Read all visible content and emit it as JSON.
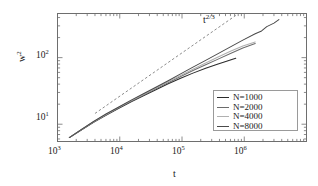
{
  "figure": {
    "background": "#ffffff",
    "frame_color": "#6e6e6e"
  },
  "annotations": {
    "slope_guide": {
      "base": "t",
      "exponent": "2/3",
      "style": "dashed",
      "color": "#8c8c8c"
    }
  },
  "legend": {
    "position": "lower-right",
    "border_color": "#9a9a9a",
    "items": [
      {
        "label": "N=1000",
        "color": "#2b2b2b"
      },
      {
        "label": "N=2000",
        "color": "#6b6b6b"
      },
      {
        "label": "N=4000",
        "color": "#b0b0b0"
      },
      {
        "label": "N=8000",
        "color": "#4a4a4a"
      }
    ]
  },
  "axes": {
    "x": {
      "title": "t",
      "scale": "log",
      "min": 1000,
      "max": 10000000,
      "tick_labels": [
        "10",
        "10",
        "10",
        "10"
      ],
      "tick_exponents": [
        "3",
        "4",
        "5",
        "6"
      ]
    },
    "y": {
      "title": "w",
      "title_exponent": "2",
      "scale": "log",
      "min": 5.5,
      "max": 460,
      "tick_labels": [
        "10",
        "10"
      ],
      "tick_exponents": [
        "1",
        "2"
      ]
    }
  },
  "chart_data": {
    "type": "line",
    "title": "",
    "xlabel": "t",
    "ylabel": "w^2",
    "xscale": "log",
    "yscale": "log",
    "xlim": [
      1000,
      10000000
    ],
    "ylim": [
      5.5,
      460
    ],
    "grid": false,
    "legend_position": "lower-right",
    "annotations": [
      {
        "text": "t^2/3",
        "x": 120000,
        "y": 330,
        "style": "dashed-guide",
        "slope": 0.6667
      }
    ],
    "guide_line": {
      "label": "t^2/3",
      "slope": 0.6667,
      "x": [
        4000,
        730000
      ],
      "y": [
        14.5,
        430
      ],
      "dash": true,
      "color": "#8c8c8c"
    },
    "series": [
      {
        "name": "N=1000",
        "color": "#2b2b2b",
        "x": [
          1550,
          2400,
          3800,
          6000,
          9500,
          15000,
          24000,
          38000,
          60000,
          95000,
          150000,
          240000,
          380000,
          520000,
          650000,
          730000
        ],
        "y": [
          6.3,
          8.2,
          10.7,
          13.6,
          17.2,
          21.6,
          26.8,
          33.0,
          40.5,
          49.0,
          58.5,
          69.0,
          80.0,
          88.0,
          94.5,
          98.0
        ]
      },
      {
        "name": "N=2000",
        "color": "#6b6b6b",
        "x": [
          1550,
          2400,
          3800,
          6000,
          9500,
          15000,
          24000,
          38000,
          60000,
          95000,
          150000,
          240000,
          380000,
          600000,
          950000,
          1500000
        ],
        "y": [
          6.3,
          8.2,
          10.8,
          13.8,
          17.5,
          22.0,
          27.5,
          34.0,
          42.0,
          52.0,
          64.0,
          78.0,
          95.0,
          115.0,
          140.0,
          163.0
        ]
      },
      {
        "name": "N=4000",
        "color": "#b0b0b0",
        "x": [
          1550,
          2400,
          3800,
          6000,
          9500,
          15000,
          24000,
          38000,
          60000,
          95000,
          150000,
          240000,
          380000,
          600000,
          950000,
          1500000
        ],
        "y": [
          6.3,
          8.3,
          10.9,
          14.0,
          17.8,
          22.4,
          28.0,
          35.0,
          43.5,
          54.0,
          67.0,
          83.0,
          102.0,
          125.0,
          150.0,
          172.0
        ]
      },
      {
        "name": "N=8000",
        "color": "#4a4a4a",
        "x": [
          1550,
          2400,
          3800,
          6000,
          9500,
          15000,
          24000,
          38000,
          60000,
          95000,
          150000,
          240000,
          380000,
          600000,
          950000,
          1500000,
          1900000,
          2300000,
          3000000,
          3600000
        ],
        "y": [
          6.3,
          8.3,
          11.0,
          14.2,
          18.0,
          22.8,
          28.6,
          36.0,
          45.0,
          57.0,
          72.0,
          91.0,
          115.0,
          145.0,
          183.0,
          228.0,
          252.0,
          292.0,
          330.0,
          372.0
        ]
      }
    ]
  }
}
